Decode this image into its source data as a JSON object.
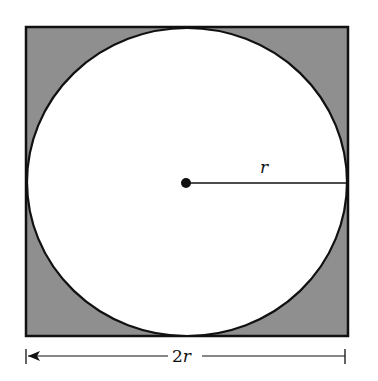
{
  "figure": {
    "type": "circle inscribed in square",
    "radius_label": "r",
    "width_label_num": "2",
    "width_label_var": "r",
    "colors": {
      "shaded": "#8f8f8f",
      "circle_fill": "#ffffff",
      "stroke": "#111111"
    }
  }
}
